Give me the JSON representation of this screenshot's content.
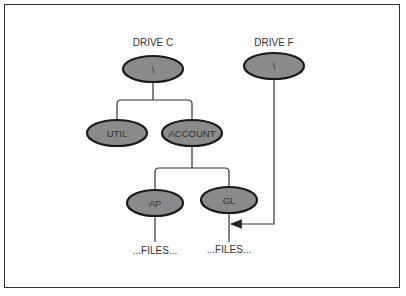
{
  "diagram": {
    "drives": [
      {
        "label": "DRIVE C",
        "root": "\\"
      },
      {
        "label": "DRIVE F",
        "root": "\\"
      }
    ],
    "nodes": {
      "c_root": "\\",
      "f_root": "\\",
      "util": "UTIL",
      "account": "ACCOUNT",
      "ap": "AP",
      "gl": "GL"
    },
    "files": [
      "...FILES...",
      "...FILES..."
    ],
    "colors": {
      "node_fill": "#8a8a8a",
      "stroke": "#1a1a1a",
      "line": "#333333"
    }
  }
}
